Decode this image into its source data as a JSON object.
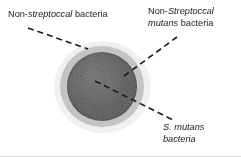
{
  "figure": {
    "background_color": "#ffffff"
  },
  "colony": {
    "zones": [
      {
        "name": "outer-halo",
        "semantic": "Non-streptoccal bacteria zone",
        "color": "#ededed"
      },
      {
        "name": "middle-ring",
        "semantic": "Non-Streptoccal mutans bacteria zone",
        "color": "#c4c4c4"
      },
      {
        "name": "inner-core",
        "semantic": "S. mutans bacteria colony",
        "color": "#585858"
      }
    ]
  },
  "labels": {
    "non_streptoccal": {
      "prefix": "Non-",
      "italic": "streptoccal",
      "suffix": " bacteria"
    },
    "non_mutans": {
      "line1_prefix": "Non-",
      "line1_italic": "Streptoccal",
      "line2_italic": "mutans",
      "line2_suffix": " bacteria"
    },
    "s_mutans": {
      "line1": "S. mutans",
      "line2": "bacteria"
    }
  },
  "leaders": {
    "stroke_color": "#1a1a1a",
    "dash_pattern": "6 4",
    "lines": [
      {
        "name": "leader-non-streptoccal",
        "x1": 28,
        "y1": 28,
        "x2": 88,
        "y2": 49
      },
      {
        "name": "leader-non-mutans",
        "x1": 124,
        "y1": 76,
        "x2": 177,
        "y2": 37
      },
      {
        "name": "leader-s-mutans",
        "x1": 95,
        "y1": 81,
        "x2": 175,
        "y2": 121
      }
    ]
  }
}
